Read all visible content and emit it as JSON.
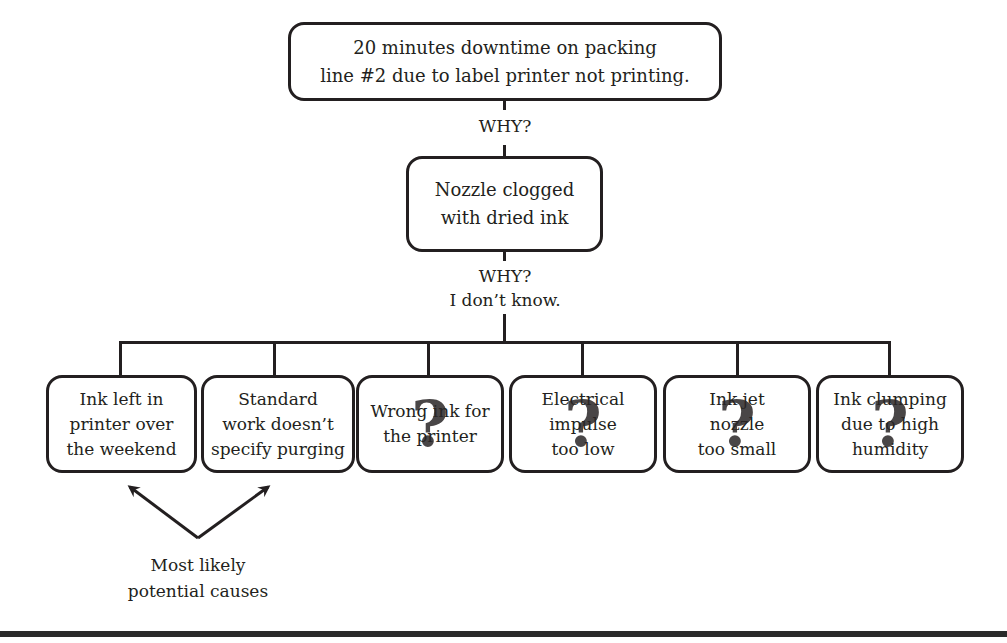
{
  "diagram": {
    "type": "5-whys root cause tree",
    "problem": "20 minutes downtime on packing\nline #2 due to label printer not printing.",
    "why_1_label": "WHY?",
    "cause_1": "Nozzle clogged\nwith dried ink",
    "why_2_label": "WHY?\nI don’t know.",
    "potential_causes": [
      {
        "text": "Ink left in\nprinter over\nthe weekend",
        "uncertain": false
      },
      {
        "text": "Standard\nwork doesn’t\nspecify purging",
        "uncertain": false
      },
      {
        "text": "Wrong ink for\nthe printer",
        "uncertain": true
      },
      {
        "text": "Electrical\nimpulse\ntoo low",
        "uncertain": true
      },
      {
        "text": "Ink jet\nnozzle\ntoo small",
        "uncertain": true
      },
      {
        "text": "Ink clumping\ndue to high\nhumidity",
        "uncertain": true
      }
    ],
    "question_mark_glyph": "?",
    "annotation": "Most likely\npotential causes",
    "colors": {
      "line": "#231f20",
      "background": "#ffffff"
    }
  }
}
